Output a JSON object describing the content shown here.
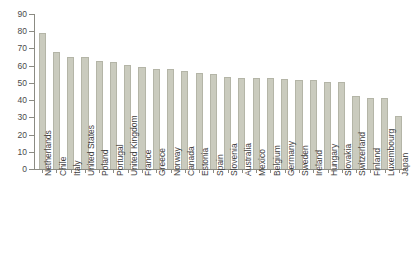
{
  "chart_data": {
    "type": "bar",
    "title": "",
    "subtitle": "",
    "xlabel": "",
    "ylabel": "",
    "ylim": [
      0,
      90
    ],
    "ytick_step": 10,
    "yticks": [
      "0",
      "10",
      "20",
      "30",
      "40",
      "50",
      "60",
      "70",
      "80",
      "90"
    ],
    "grid": false,
    "legend": "none",
    "bar_color": "#cacbbe",
    "bar_edge_color": "#b4b5a7",
    "axis_color": "#8b8b83",
    "categories": [
      "Netherlands",
      "Chile",
      "Italy",
      "United States",
      "Poland",
      "Portugal",
      "United Kingdom",
      "France",
      "Greece",
      "Norway",
      "Canada",
      "Estonia",
      "Spain",
      "Slovenia",
      "Australia",
      "Mexico",
      "Belgium",
      "Germany",
      "Sweden",
      "Ireland",
      "Hungary",
      "Slovakia",
      "Switzerland",
      "Finland",
      "Luxembourg",
      "Japan"
    ],
    "values": [
      79,
      68,
      65,
      65,
      63,
      62,
      60.5,
      59,
      58,
      58,
      57,
      56,
      55,
      53.5,
      53,
      53,
      53,
      52,
      51.5,
      51.5,
      50.5,
      50.5,
      42.5,
      41.5,
      41,
      31
    ]
  },
  "page": {
    "clipped_title": "",
    "clipped_footer": ""
  }
}
